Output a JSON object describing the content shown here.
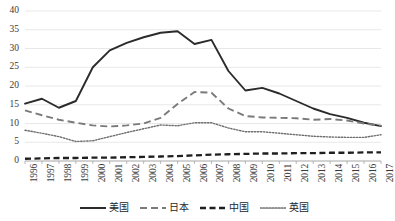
{
  "chart_data": {
    "type": "line",
    "title": "",
    "xlabel": "",
    "ylabel": "",
    "ylim": [
      0,
      40
    ],
    "ytick_step": 5,
    "grid": true,
    "legend_position": "bottom",
    "yticks": [
      "40",
      "35",
      "30",
      "25",
      "20",
      "15",
      "10",
      "5",
      "0"
    ],
    "categories": [
      "1996",
      "1997",
      "1998",
      "1999",
      "2000",
      "2001",
      "2002",
      "2003",
      "2004",
      "2005",
      "2006",
      "2007",
      "2008",
      "2009",
      "2010",
      "2011",
      "2012",
      "2013",
      "2014",
      "2015",
      "2016",
      "2017"
    ],
    "series": [
      {
        "name": "美国",
        "style": "solid",
        "color": "#2b2b2b",
        "values": [
          15.3,
          16.6,
          14.2,
          16.0,
          25.0,
          29.5,
          31.5,
          33.0,
          34.2,
          34.6,
          31.2,
          32.3,
          24.0,
          18.8,
          19.5,
          18.0,
          16.0,
          14.0,
          12.5,
          11.5,
          10.2,
          9.3
        ]
      },
      {
        "name": "日本",
        "style": "dashed",
        "color": "#7a7a7a",
        "values": [
          13.5,
          12.2,
          11.0,
          10.2,
          9.5,
          9.2,
          9.5,
          10.0,
          11.5,
          15.2,
          18.4,
          18.2,
          14.0,
          12.0,
          11.6,
          11.5,
          11.4,
          11.0,
          11.2,
          10.8,
          10.0,
          9.4
        ]
      },
      {
        "name": "中国",
        "style": "bold-dashed",
        "color": "#1f1f1f",
        "values": [
          0.6,
          0.7,
          0.8,
          0.8,
          0.9,
          0.9,
          1.0,
          1.1,
          1.2,
          1.3,
          1.5,
          1.7,
          1.8,
          1.9,
          2.0,
          2.0,
          2.1,
          2.1,
          2.2,
          2.2,
          2.3,
          2.3
        ]
      },
      {
        "name": "英国",
        "style": "dotted",
        "color": "#6f6f6f",
        "values": [
          8.2,
          7.4,
          6.5,
          5.2,
          5.4,
          6.5,
          7.6,
          8.6,
          9.6,
          9.4,
          10.2,
          10.2,
          8.8,
          7.8,
          7.8,
          7.4,
          7.0,
          6.6,
          6.4,
          6.3,
          6.3,
          7.0
        ]
      }
    ]
  },
  "legend": {
    "items": [
      {
        "label": "美国",
        "swatch": "solid-line-swatch"
      },
      {
        "label": "日本",
        "swatch": "dashed-line-swatch"
      },
      {
        "label": "中国",
        "swatch": "bold-dashed-line-swatch"
      },
      {
        "label": "英国",
        "swatch": "dotted-line-swatch"
      }
    ]
  }
}
